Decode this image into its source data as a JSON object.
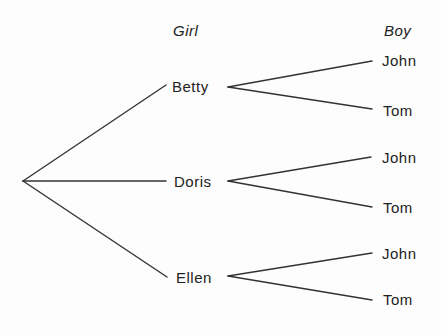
{
  "diagram": {
    "type": "tree",
    "headers": {
      "girl": "Girl",
      "boy": "Boy"
    },
    "root": {
      "x": 23,
      "y": 181
    },
    "girls": [
      {
        "name": "Betty",
        "line_end": {
          "x": 166,
          "y": 85
        },
        "label_pos": {
          "x": 172,
          "y": 87
        },
        "branch_start": {
          "x": 228,
          "y": 87
        },
        "boys": [
          {
            "name": "John",
            "line_end": {
              "x": 372,
              "y": 61
            },
            "label_pos": {
              "x": 382,
              "y": 61
            }
          },
          {
            "name": "Tom",
            "line_end": {
              "x": 372,
              "y": 109
            },
            "label_pos": {
              "x": 383,
              "y": 111
            }
          }
        ]
      },
      {
        "name": "Doris",
        "line_end": {
          "x": 166,
          "y": 181
        },
        "label_pos": {
          "x": 174,
          "y": 182
        },
        "branch_start": {
          "x": 228,
          "y": 181
        },
        "boys": [
          {
            "name": "John",
            "line_end": {
              "x": 371,
              "y": 157
            },
            "label_pos": {
              "x": 382,
              "y": 158
            }
          },
          {
            "name": "Tom",
            "line_end": {
              "x": 372,
              "y": 207
            },
            "label_pos": {
              "x": 383,
              "y": 208
            }
          }
        ]
      },
      {
        "name": "Ellen",
        "line_end": {
          "x": 167,
          "y": 277
        },
        "label_pos": {
          "x": 176,
          "y": 278
        },
        "branch_start": {
          "x": 228,
          "y": 276
        },
        "boys": [
          {
            "name": "John",
            "line_end": {
              "x": 372,
              "y": 253
            },
            "label_pos": {
              "x": 382,
              "y": 254
            }
          },
          {
            "name": "Tom",
            "line_end": {
              "x": 372,
              "y": 300
            },
            "label_pos": {
              "x": 383,
              "y": 300
            }
          }
        ]
      }
    ],
    "colors": {
      "background": "#fdfdfd",
      "ink": "#222222",
      "line": "#333333"
    }
  }
}
